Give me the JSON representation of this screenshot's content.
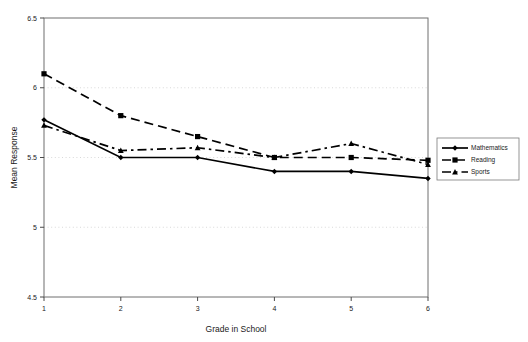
{
  "chart_data": {
    "type": "line",
    "title": "",
    "xlabel": "Grade in School",
    "ylabel": "Mean Response",
    "x": [
      1,
      2,
      3,
      4,
      5,
      6
    ],
    "categories": [
      "1",
      "2",
      "3",
      "4",
      "5",
      "6"
    ],
    "xlim": [
      1,
      6
    ],
    "ylim": [
      4.5,
      6.5
    ],
    "yticks": [
      4.5,
      5,
      5.5,
      6,
      6.5
    ],
    "ytick_labels": [
      "4.5",
      "5",
      "5.5",
      "6",
      "6.5"
    ],
    "xticks": [
      1,
      2,
      3,
      4,
      5,
      6
    ],
    "xtick_labels": [
      "1",
      "2",
      "3",
      "4",
      "5",
      "6"
    ],
    "grid": "horizontal-dotted",
    "legend_position": "right-outside",
    "series": [
      {
        "name": "Mathematics",
        "marker": "diamond",
        "line_style": "solid",
        "values": [
          5.77,
          5.5,
          5.5,
          5.4,
          5.4,
          5.35
        ]
      },
      {
        "name": "Reading",
        "marker": "square",
        "line_style": "dashed",
        "values": [
          6.1,
          5.8,
          5.65,
          5.5,
          5.5,
          5.48
        ]
      },
      {
        "name": "Sports",
        "marker": "triangle",
        "line_style": "dash-dot",
        "values": [
          5.73,
          5.55,
          5.57,
          5.5,
          5.6,
          5.45
        ]
      }
    ]
  },
  "legend": {
    "entries": [
      {
        "label": "Mathematics"
      },
      {
        "label": "Reading"
      },
      {
        "label": "Sports"
      }
    ]
  },
  "axes": {
    "x_title": "Grade in School",
    "y_title": "Mean Response"
  }
}
